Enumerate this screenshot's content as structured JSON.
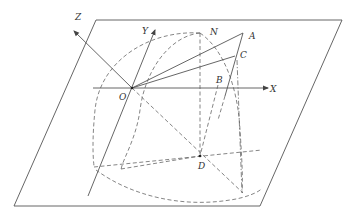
{
  "diagram": {
    "type": "3d-geometry-coordinate-system",
    "colors": {
      "line": "#555555",
      "dashed": "#666666",
      "label": "#333333",
      "background": "#ffffff"
    },
    "axes": {
      "x": {
        "label": "X"
      },
      "y": {
        "label": "Y"
      },
      "z": {
        "label": "Z"
      }
    },
    "points": {
      "O": "O",
      "N": "N",
      "A": "A",
      "B": "B",
      "C": "C",
      "D": "D"
    }
  }
}
